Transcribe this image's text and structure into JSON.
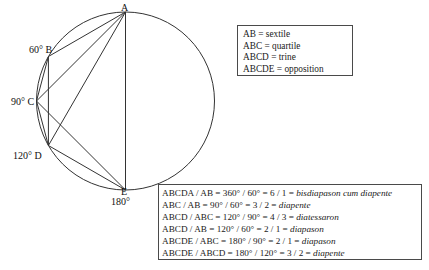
{
  "diagram": {
    "circle": {
      "center_x": 125.5,
      "center_y": 101,
      "radius": 89,
      "stroke": "#333333"
    },
    "vertices": [
      {
        "id": "A",
        "label": "A",
        "angle_deg": 0,
        "label_x": 121,
        "label_y": 2
      },
      {
        "id": "B",
        "label": "60° B",
        "angle_deg": 60,
        "label_x": 29,
        "label_y": 44
      },
      {
        "id": "C",
        "label": "90° C",
        "angle_deg": 90,
        "label_x": 11,
        "label_y": 96
      },
      {
        "id": "D",
        "label": "120° D",
        "angle_deg": 120,
        "label_x": 13,
        "label_y": 150
      },
      {
        "id": "E",
        "label": "E",
        "angle_deg": 180,
        "label_x": 121,
        "label_y": 186
      },
      {
        "id": "E_deg",
        "label": "180°",
        "angle_deg": 180,
        "label_x": 111,
        "label_y": 196
      }
    ],
    "chords": [
      {
        "from": "A",
        "to": "B"
      },
      {
        "from": "A",
        "to": "C"
      },
      {
        "from": "A",
        "to": "D"
      },
      {
        "from": "A",
        "to": "E"
      },
      {
        "from": "B",
        "to": "C"
      },
      {
        "from": "C",
        "to": "D"
      },
      {
        "from": "C",
        "to": "E"
      },
      {
        "from": "D",
        "to": "E"
      },
      {
        "from": "B",
        "to": "D"
      }
    ]
  },
  "definitions": {
    "lines": [
      "AB = sextile",
      "ABC = quartile",
      "ABCD = trine",
      "ABCDE = opposition"
    ]
  },
  "ratios": {
    "lines": [
      {
        "plain": "ABCDA / AB = 360° / 60° = 6 / 1 = ",
        "term": "bisdiapason cum diapente"
      },
      {
        "plain": "ABC / AB = 90° / 60° = 3 / 2 = ",
        "term": "diapente"
      },
      {
        "plain": "ABCD / ABC = 120° / 90° = 4 / 3 = ",
        "term": "diatessaron"
      },
      {
        "plain": "ABCD / AB = 120° / 60° = 2 / 1 = ",
        "term": "diapason"
      },
      {
        "plain": "ABCDE / ABC = 180° / 90° = 2 / 1 = ",
        "term": "diapason"
      },
      {
        "plain": "ABCDE / ABCD = 180° / 120° = 3 / 2 = ",
        "term": "diapente"
      }
    ]
  },
  "colors": {
    "stroke": "#333333",
    "box_border": "#4a4a4a",
    "background": "#ffffff",
    "text": "#111111"
  }
}
